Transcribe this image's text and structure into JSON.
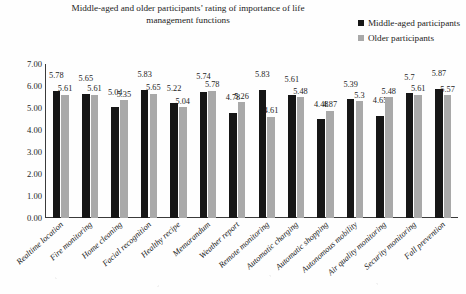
{
  "title": {
    "line1": "Middle-aged and older participants’ rating of importance of life",
    "line2": "management functions"
  },
  "legend": {
    "position": "top-right",
    "items": [
      {
        "label": "Middle-aged participants",
        "color": "#161616",
        "marker": "square-marker"
      },
      {
        "label": "Older participants",
        "color": "#a9a9a9",
        "marker": "square-marker"
      }
    ]
  },
  "y_axis": {
    "ticks": [
      "7.00",
      "6.00",
      "5.00",
      "4.00",
      "3.00",
      "2.00",
      "1.00",
      "0.00"
    ]
  },
  "chart_data": {
    "type": "bar",
    "title": "Middle-aged and older participants’ rating of importance of life management functions",
    "xlabel": "",
    "ylabel": "",
    "ylim": [
      0,
      7
    ],
    "ytick_step": 1,
    "grid": false,
    "legend_position": "top-right",
    "categories": [
      "Realtime location",
      "Fire monitoring",
      "Home cleaning",
      "Facial recognition",
      "Healthy recipe",
      "Memorandum",
      "Weather report",
      "Remote monitoring",
      "Automatic charging",
      "Automatic shopping",
      "Autonomous mobility",
      "Air quality monitoring",
      "Security monitoring",
      "Fall prevention"
    ],
    "series": [
      {
        "name": "Middle-aged participants",
        "color": "#161616",
        "values": [
          5.78,
          5.65,
          5.04,
          5.83,
          5.22,
          5.74,
          4.78,
          5.83,
          5.61,
          4.48,
          5.39,
          4.65,
          5.7,
          5.87
        ],
        "labels": [
          "5.78",
          "5.65",
          "5.04",
          "5.83",
          "5.22",
          "5.74",
          "4.78",
          "5.83",
          "5.61",
          "4.48",
          "5.39",
          "4.65",
          "5.7",
          "5.87"
        ]
      },
      {
        "name": "Older participants",
        "color": "#a9a9a9",
        "values": [
          5.61,
          5.61,
          5.35,
          5.65,
          5.04,
          5.78,
          5.26,
          4.61,
          5.48,
          4.87,
          5.3,
          5.48,
          5.61,
          5.57
        ],
        "labels": [
          "5.61",
          "5.61",
          "5.35",
          "5.65",
          "5.04",
          "5.78",
          "5.26",
          "4.61",
          "5.48",
          "4.87",
          "5.3",
          "5.48",
          "5.61",
          "5.57"
        ]
      }
    ]
  }
}
